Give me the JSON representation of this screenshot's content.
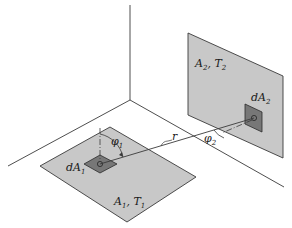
{
  "diagram": {
    "type": "radiation view factor geometry",
    "colors": {
      "background": "#ffffff",
      "line": "#3a3a3a",
      "surface": "#c8c8c8",
      "element": "#777777"
    },
    "surfaces": [
      {
        "id": "surface-1",
        "label_main": "A",
        "label_sub": "1",
        "label_temp": "T",
        "label_temp_sub": "1",
        "orientation": "horizontal floor"
      },
      {
        "id": "surface-2",
        "label_main": "A",
        "label_sub": "2",
        "label_temp": "T",
        "label_temp_sub": "2",
        "orientation": "vertical wall"
      }
    ],
    "elements": [
      {
        "id": "element-1",
        "label_prefix": "dA",
        "label_sub": "1"
      },
      {
        "id": "element-2",
        "label_prefix": "dA",
        "label_sub": "2"
      }
    ],
    "angles": [
      {
        "id": "angle-1",
        "symbol": "φ",
        "sub": "1"
      },
      {
        "id": "angle-2",
        "symbol": "φ",
        "sub": "2"
      }
    ],
    "distance": {
      "symbol": "r"
    }
  }
}
